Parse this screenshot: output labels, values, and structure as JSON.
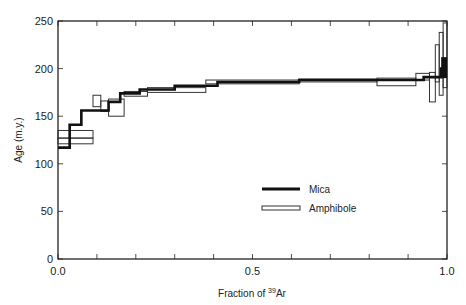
{
  "chart_data": {
    "type": "line",
    "subtype": "step-spectrum",
    "title": "",
    "xlabel": "Fraction of 39Ar",
    "xlabel_parts": {
      "prefix": "Fraction of ",
      "superscript": "39",
      "suffix": "Ar"
    },
    "ylabel": "Age (m.y.)",
    "xlim": [
      0.0,
      1.0
    ],
    "ylim": [
      0,
      250
    ],
    "x_ticks": [
      0.0,
      0.1,
      0.2,
      0.3,
      0.4,
      0.5,
      0.6,
      0.7,
      0.8,
      0.9,
      1.0
    ],
    "x_tick_labels": [
      {
        "value": 0.0,
        "label": "0.0"
      },
      {
        "value": 0.5,
        "label": "0.5"
      },
      {
        "value": 1.0,
        "label": "1.0"
      }
    ],
    "y_ticks": [
      0,
      50,
      100,
      150,
      200,
      250
    ],
    "y_tick_labels": [
      "0",
      "50",
      "100",
      "150",
      "200",
      "250"
    ],
    "grid": false,
    "legend": {
      "position": "center-right inside",
      "entries": [
        {
          "name": "Mica",
          "style": "thick solid line"
        },
        {
          "name": "Amphibole",
          "style": "open box (age ± error)"
        }
      ]
    },
    "series": [
      {
        "name": "Mica",
        "steps": [
          {
            "x0": 0.0,
            "x1": 0.03,
            "age": 117
          },
          {
            "x0": 0.03,
            "x1": 0.06,
            "age": 141
          },
          {
            "x0": 0.06,
            "x1": 0.13,
            "age": 156
          },
          {
            "x0": 0.13,
            "x1": 0.16,
            "age": 165
          },
          {
            "x0": 0.16,
            "x1": 0.21,
            "age": 174
          },
          {
            "x0": 0.21,
            "x1": 0.3,
            "age": 178
          },
          {
            "x0": 0.3,
            "x1": 0.41,
            "age": 182
          },
          {
            "x0": 0.41,
            "x1": 0.62,
            "age": 186
          },
          {
            "x0": 0.62,
            "x1": 0.94,
            "age": 188
          },
          {
            "x0": 0.94,
            "x1": 0.985,
            "age": 191
          },
          {
            "x0": 0.985,
            "x1": 1.0,
            "age": 200,
            "min": 190,
            "max": 212
          }
        ]
      },
      {
        "name": "Amphibole",
        "boxes": [
          {
            "x0": 0.0,
            "x1": 0.09,
            "age_low": 127,
            "age_high": 135
          },
          {
            "x0": 0.0,
            "x1": 0.09,
            "age_low": 121,
            "age_high": 127
          },
          {
            "x0": 0.09,
            "x1": 0.11,
            "age_low": 160,
            "age_high": 172
          },
          {
            "x0": 0.11,
            "x1": 0.13,
            "age_low": 155,
            "age_high": 166
          },
          {
            "x0": 0.13,
            "x1": 0.17,
            "age_low": 150,
            "age_high": 168
          },
          {
            "x0": 0.17,
            "x1": 0.23,
            "age_low": 171,
            "age_high": 176
          },
          {
            "x0": 0.23,
            "x1": 0.38,
            "age_low": 175,
            "age_high": 180
          },
          {
            "x0": 0.38,
            "x1": 0.62,
            "age_low": 184,
            "age_high": 188
          },
          {
            "x0": 0.62,
            "x1": 0.82,
            "age_low": 186,
            "age_high": 189
          },
          {
            "x0": 0.82,
            "x1": 0.92,
            "age_low": 182,
            "age_high": 190
          },
          {
            "x0": 0.92,
            "x1": 0.955,
            "age_low": 188,
            "age_high": 195
          },
          {
            "x0": 0.955,
            "x1": 0.97,
            "age_low": 165,
            "age_high": 196
          },
          {
            "x0": 0.97,
            "x1": 0.98,
            "age_low": 186,
            "age_high": 225
          },
          {
            "x0": 0.98,
            "x1": 0.99,
            "age_low": 172,
            "age_high": 238
          },
          {
            "x0": 0.99,
            "x1": 1.0,
            "age_low": 180,
            "age_high": 248
          }
        ]
      }
    ]
  },
  "colors": {
    "ink": "#222222",
    "mica": "#111111",
    "amphibole": "#333333",
    "background": "#ffffff"
  }
}
